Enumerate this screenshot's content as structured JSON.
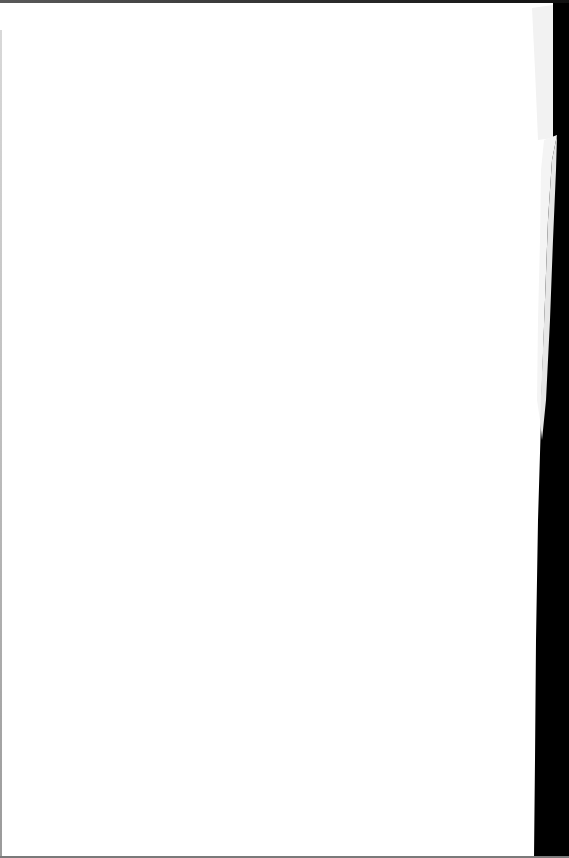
{
  "document": {
    "type": "scanned-page",
    "content": "",
    "colors": {
      "paper": "#ffffff",
      "folded_edge": "#f1f1f1",
      "background": "#000000"
    }
  }
}
